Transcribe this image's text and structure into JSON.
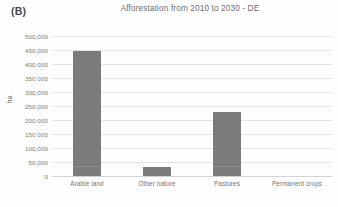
{
  "panel": {
    "letter": "(B)"
  },
  "chart_data": {
    "type": "bar",
    "title": "Afforestation from 2010 to 2030 - DE",
    "xlabel": "",
    "ylabel": "ha",
    "categories": [
      "Arable land",
      "Other nature",
      "Pastures",
      "Permanent crops"
    ],
    "values": [
      447000,
      32000,
      229000,
      0
    ],
    "series": [
      {
        "name": "Afforestation",
        "values": [
          447000,
          32000,
          229000,
          0
        ]
      }
    ],
    "ylim": [
      0,
      500000
    ],
    "ytick_values": [
      0,
      50000,
      100000,
      150000,
      200000,
      250000,
      300000,
      350000,
      400000,
      450000,
      500000
    ],
    "ytick_labels": [
      "0",
      "50,000",
      "100,000",
      "150,000",
      "200,000",
      "250,000",
      "300,000",
      "350,000",
      "400,000",
      "450,000",
      "500,000"
    ],
    "grid": true,
    "grid_axis": "y",
    "legend": false,
    "legend_position": "none",
    "bar_color": "#7c7c7c",
    "gridline_color": "#e4e4e4",
    "text_color": "#6d6d6d",
    "background_color": "#fefefe"
  }
}
